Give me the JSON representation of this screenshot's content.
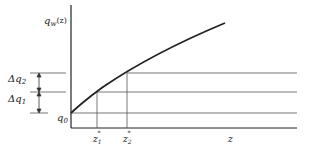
{
  "diagram": {
    "y_axis_label": "q",
    "y_axis_label_sub": "w",
    "y_axis_label_arg": "(z)",
    "x_axis_label": "z",
    "q0_label": "q",
    "q0_sub": "0",
    "delta_q1_label": "Δq",
    "delta_q1_sub": "1",
    "delta_q2_label": "Δq",
    "delta_q2_sub": "2",
    "z1_label": "z",
    "z1_sub": "1",
    "z1_sup": "*",
    "z2_label": "z",
    "z2_sub": "2",
    "z2_sup": "*",
    "line_color": "#222222",
    "guide_color": "#555555"
  }
}
